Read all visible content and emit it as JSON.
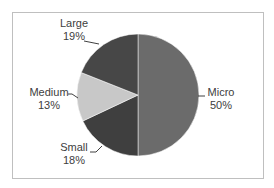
{
  "chart_data": {
    "type": "pie",
    "title": "",
    "categories": [
      "Micro",
      "Small",
      "Medium",
      "Large"
    ],
    "values": [
      50,
      18,
      13,
      19
    ],
    "value_format": "percent",
    "colors": {
      "Micro": "#6b6b6b",
      "Small": "#3f3f3f",
      "Medium": "#c8c8c8",
      "Large": "#474747"
    },
    "start_angle_deg": 0,
    "direction": "clockwise",
    "legend": "none",
    "data_labels": "outside_with_leader_lines"
  },
  "labels": {
    "micro": {
      "name": "Micro",
      "pct": "50%"
    },
    "small": {
      "name": "Small",
      "pct": "18%"
    },
    "medium": {
      "name": "Medium",
      "pct": "13%"
    },
    "large": {
      "name": "Large",
      "pct": "19%"
    }
  }
}
